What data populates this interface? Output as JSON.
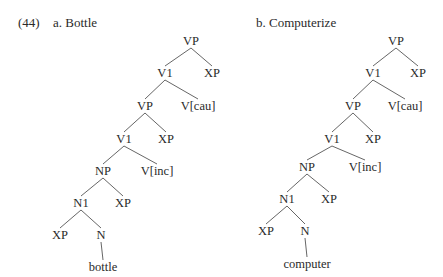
{
  "example_number": "(44)",
  "trees": [
    {
      "label": "a. Bottle",
      "nodes": [
        {
          "id": "vp1",
          "text": "VP",
          "x": 191,
          "y": 45
        },
        {
          "id": "v1a",
          "text": "V1",
          "x": 165,
          "y": 77
        },
        {
          "id": "xp1",
          "text": "XP",
          "x": 212,
          "y": 77
        },
        {
          "id": "vp2",
          "text": "VP",
          "x": 145,
          "y": 110
        },
        {
          "id": "vcau",
          "text": "V[cau]",
          "x": 198,
          "y": 110
        },
        {
          "id": "v1b",
          "text": "V1",
          "x": 124,
          "y": 143
        },
        {
          "id": "xp2",
          "text": "XP",
          "x": 166,
          "y": 143
        },
        {
          "id": "np",
          "text": "NP",
          "x": 103,
          "y": 175
        },
        {
          "id": "vinc",
          "text": "V[inc]",
          "x": 157,
          "y": 175
        },
        {
          "id": "n1",
          "text": "N1",
          "x": 81,
          "y": 207
        },
        {
          "id": "xp3",
          "text": "XP",
          "x": 123,
          "y": 207
        },
        {
          "id": "xp4",
          "text": "XP",
          "x": 60,
          "y": 239
        },
        {
          "id": "n",
          "text": "N",
          "x": 101,
          "y": 239
        },
        {
          "id": "leaf",
          "text": "bottle",
          "x": 103,
          "y": 271
        }
      ],
      "edges": [
        [
          "vp1",
          "v1a"
        ],
        [
          "vp1",
          "xp1"
        ],
        [
          "v1a",
          "vp2"
        ],
        [
          "v1a",
          "vcau"
        ],
        [
          "vp2",
          "v1b"
        ],
        [
          "vp2",
          "xp2"
        ],
        [
          "v1b",
          "np"
        ],
        [
          "v1b",
          "vinc"
        ],
        [
          "np",
          "n1"
        ],
        [
          "np",
          "xp3"
        ],
        [
          "n1",
          "xp4"
        ],
        [
          "n1",
          "n"
        ],
        [
          "n",
          "leaf"
        ]
      ]
    },
    {
      "label": "b. Computerize",
      "nodes": [
        {
          "id": "vp1",
          "text": "VP",
          "x": 396,
          "y": 45
        },
        {
          "id": "v1a",
          "text": "V1",
          "x": 373,
          "y": 77
        },
        {
          "id": "xp1",
          "text": "XP",
          "x": 418,
          "y": 77
        },
        {
          "id": "vp2",
          "text": "VP",
          "x": 353,
          "y": 110
        },
        {
          "id": "vcau",
          "text": "V[cau]",
          "x": 405,
          "y": 110
        },
        {
          "id": "v1b",
          "text": "V1",
          "x": 332,
          "y": 143
        },
        {
          "id": "xp2",
          "text": "XP",
          "x": 373,
          "y": 143
        },
        {
          "id": "np",
          "text": "NP",
          "x": 307,
          "y": 171
        },
        {
          "id": "vinc",
          "text": "V[inc]",
          "x": 365,
          "y": 171
        },
        {
          "id": "n1",
          "text": "N1",
          "x": 287,
          "y": 203
        },
        {
          "id": "xp3",
          "text": "XP",
          "x": 329,
          "y": 203
        },
        {
          "id": "xp4",
          "text": "XP",
          "x": 266,
          "y": 235
        },
        {
          "id": "n",
          "text": "N",
          "x": 305,
          "y": 235
        },
        {
          "id": "leaf",
          "text": "computer",
          "x": 307,
          "y": 268
        }
      ],
      "edges": [
        [
          "vp1",
          "v1a"
        ],
        [
          "vp1",
          "xp1"
        ],
        [
          "v1a",
          "vp2"
        ],
        [
          "v1a",
          "vcau"
        ],
        [
          "vp2",
          "v1b"
        ],
        [
          "vp2",
          "xp2"
        ],
        [
          "v1b",
          "np"
        ],
        [
          "v1b",
          "vinc"
        ],
        [
          "np",
          "n1"
        ],
        [
          "np",
          "xp3"
        ],
        [
          "n1",
          "xp4"
        ],
        [
          "n1",
          "n"
        ],
        [
          "n",
          "leaf"
        ]
      ]
    }
  ]
}
